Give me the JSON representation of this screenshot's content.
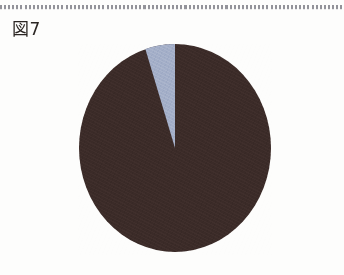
{
  "page": {
    "background_color": "#fdfdfc",
    "divider": "dotted-rule"
  },
  "figure": {
    "label": "図7"
  },
  "chart_data": {
    "type": "pie",
    "title": "図7",
    "xlabel": "",
    "ylabel": "",
    "grid": false,
    "legend": "none",
    "start_angle_deg": 0,
    "direction": "counterclockwise",
    "categories": [
      "区分1",
      "区分2"
    ],
    "values": [
      95,
      5
    ],
    "unit": "%",
    "colors": [
      "#3b2b28",
      "#a3aec8"
    ],
    "slices": [
      {
        "label": "区分1",
        "value": 95,
        "color": "#3b2b28",
        "start_angle_deg": 0,
        "end_angle_deg": 342
      },
      {
        "label": "区分2",
        "value": 5,
        "color": "#a3aec8",
        "start_angle_deg": 342,
        "end_angle_deg": 360
      }
    ],
    "annotations": []
  }
}
